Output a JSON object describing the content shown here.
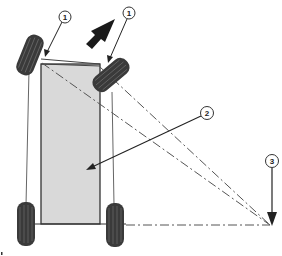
{
  "diagram": {
    "callouts": [
      {
        "id": "callout-1a",
        "label": "1",
        "target": "front-left-wheel-pivot"
      },
      {
        "id": "callout-1b",
        "label": "1",
        "target": "front-right-wheel-pivot"
      },
      {
        "id": "callout-2",
        "label": "2",
        "target": "vehicle-body"
      },
      {
        "id": "callout-3",
        "label": "3",
        "target": "turning-center-point"
      }
    ],
    "direction_arrow": {
      "icon": "direction-arrow-icon",
      "meaning": "travel direction (forward-right)"
    },
    "colors": {
      "body_fill": "#d9d9d9",
      "body_outline": "#333333",
      "tire": "#3a3a3a",
      "line": "#555555",
      "arrow": "#1a1a1a",
      "background": "#ffffff"
    }
  }
}
